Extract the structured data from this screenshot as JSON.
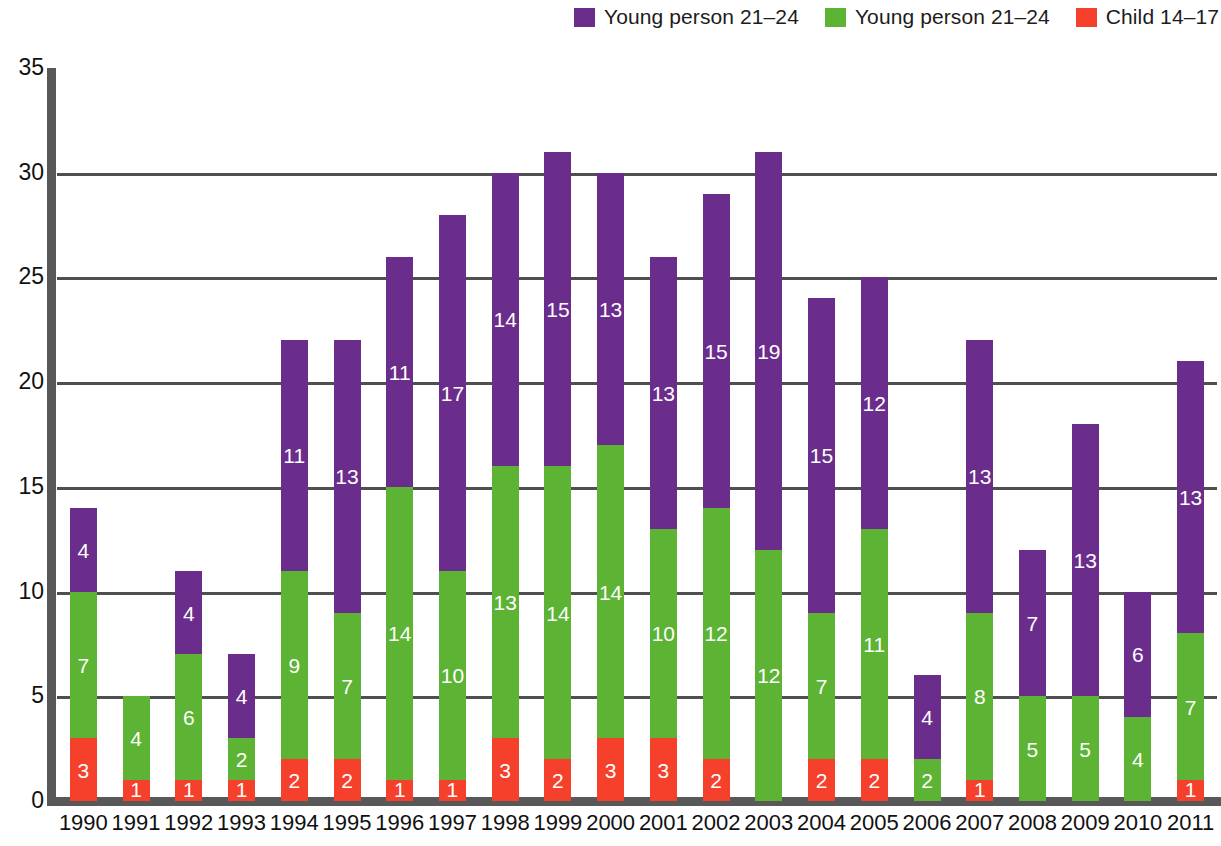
{
  "legend": {
    "items": [
      {
        "label": "Young person 21–24",
        "color": "#6B2D8B",
        "key": "purple"
      },
      {
        "label": "Young person 21–24",
        "color": "#5CB334",
        "key": "green"
      },
      {
        "label": "Child 14–17",
        "color": "#F5402C",
        "key": "red"
      }
    ]
  },
  "axis": {
    "y_ticks": [
      "0",
      "5",
      "10",
      "15",
      "20",
      "25",
      "30",
      "35"
    ],
    "y_min": 0,
    "y_max": 35,
    "y_step": 5,
    "gridline_values": [
      5,
      10,
      15,
      20,
      25,
      30
    ],
    "axis_color": "#585858",
    "grid_color": "#4F4F4F"
  },
  "chart_data": {
    "type": "bar",
    "title": "",
    "subtitle": "",
    "xlabel": "",
    "ylabel": "",
    "ylim": [
      0,
      35
    ],
    "grid": true,
    "stacked": true,
    "legend_position": "top-right",
    "categories": [
      "1990",
      "1991",
      "1992",
      "1993",
      "1994",
      "1995",
      "1996",
      "1997",
      "1998",
      "1999",
      "2000",
      "2001",
      "2002",
      "2003",
      "2004",
      "2005",
      "2006",
      "2007",
      "2008",
      "2009",
      "2010",
      "2011"
    ],
    "series": [
      {
        "name": "Child 14–17",
        "color": "#F5402C",
        "values": [
          3,
          1,
          1,
          1,
          2,
          2,
          1,
          1,
          3,
          2,
          3,
          3,
          2,
          0,
          2,
          2,
          0,
          1,
          0,
          0,
          0,
          1
        ]
      },
      {
        "name": "Young person 21–24",
        "color": "#5CB334",
        "values": [
          7,
          4,
          6,
          2,
          9,
          7,
          14,
          10,
          13,
          14,
          14,
          10,
          12,
          12,
          7,
          11,
          2,
          8,
          5,
          5,
          4,
          7
        ]
      },
      {
        "name": "Young person 21–24",
        "color": "#6B2D8B",
        "values": [
          4,
          0,
          4,
          4,
          11,
          13,
          11,
          17,
          14,
          15,
          13,
          13,
          15,
          19,
          15,
          12,
          4,
          13,
          7,
          13,
          6,
          13
        ]
      }
    ],
    "totals": [
      14,
      5,
      11,
      7,
      22,
      22,
      26,
      28,
      30,
      31,
      30,
      26,
      29,
      31,
      24,
      25,
      6,
      22,
      12,
      18,
      10,
      21
    ]
  }
}
